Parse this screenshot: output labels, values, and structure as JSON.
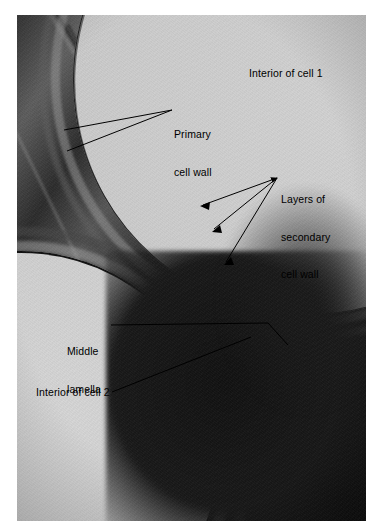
{
  "figure": {
    "type": "electron-micrograph",
    "background_color": "#ffffff",
    "plate_tone": "grayscale"
  },
  "annotations": [
    {
      "id": "interior-cell-1",
      "text": "Interior of cell 1",
      "lines": [
        "Interior of cell 1"
      ],
      "x": 249,
      "y": 67,
      "has_leader": false,
      "color": "#000000"
    },
    {
      "id": "primary-cell-wall",
      "text": "Primary cell wall",
      "lines": [
        "Primary",
        "cell wall"
      ],
      "x": 174,
      "y": 103,
      "has_leader": true,
      "leader_count": 2,
      "color": "#000000"
    },
    {
      "id": "layers-secondary-cell-wall",
      "text": "Layers of secondary cell wall",
      "lines": [
        "Layers of",
        "secondary",
        "cell wall"
      ],
      "x": 281,
      "y": 168,
      "has_leader": true,
      "leader_count": 3,
      "arrowheads": true,
      "color": "#000000"
    },
    {
      "id": "middle-lamella",
      "text": "Middle lamella",
      "lines": [
        "Middle",
        "lamella"
      ],
      "x": 67,
      "y": 320,
      "has_leader": true,
      "leader_count": 1,
      "color": "#000000"
    },
    {
      "id": "interior-cell-2",
      "text": "Interior of cell 2",
      "lines": [
        "Interior of cell 2"
      ],
      "x": 36,
      "y": 386,
      "has_leader": true,
      "leader_count": 1,
      "color": "#000000"
    }
  ],
  "structures": {
    "cell_1_lumen_label": "Interior of cell 1",
    "cell_2_lumen_label": "Interior of cell 2",
    "wall_layers": [
      "Primary cell wall",
      "Layers of secondary cell wall",
      "Middle lamella"
    ]
  }
}
